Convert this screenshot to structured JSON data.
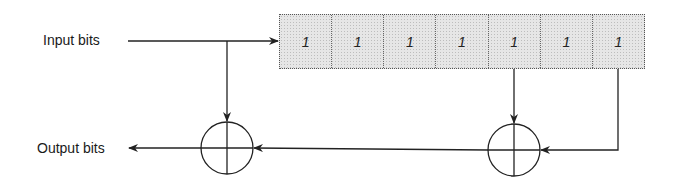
{
  "labels": {
    "input": "Input bits",
    "output": "Output bits"
  },
  "register": {
    "cells": [
      "1",
      "1",
      "1",
      "1",
      "1",
      "1",
      "1"
    ],
    "taps": [
      5,
      7
    ]
  },
  "operators": [
    {
      "name": "xor-left",
      "symbol": "xor-circle"
    },
    {
      "name": "xor-right",
      "symbol": "xor-circle"
    }
  ],
  "colors": {
    "line": "#222222",
    "register_fill": "#e6e6e6"
  }
}
